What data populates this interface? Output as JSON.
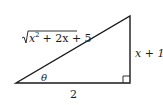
{
  "diagram": {
    "type": "right-triangle",
    "hypotenuse_label": {
      "radicand_base": "x",
      "exponent": "2",
      "rest": " + 2x + 5"
    },
    "vertical_leg_label": "x + 1",
    "horizontal_leg_label": "2",
    "angle_label": "θ",
    "right_angle_marker": true,
    "stroke_color": "#1a1a1a"
  }
}
